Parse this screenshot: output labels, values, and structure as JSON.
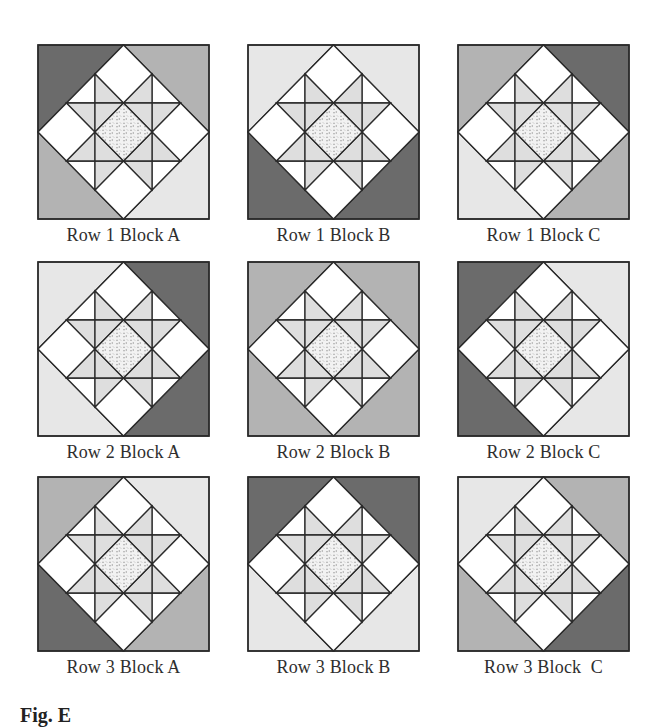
{
  "colors": {
    "dark": "#6b6b6b",
    "medium": "#b3b3b3",
    "light": "#e7e7e7",
    "star": "#dedede",
    "white": "#ffffff",
    "center_pattern_fg": "#9a9a9a",
    "center_pattern_bg": "#f2f2f2",
    "line": "#2a2a2a"
  },
  "blocks": [
    {
      "label": "Row 1 Block A",
      "corners": {
        "tl": "dark",
        "tr": "medium",
        "bl": "medium",
        "br": "light"
      }
    },
    {
      "label": "Row 1 Block B",
      "corners": {
        "tl": "light",
        "tr": "light",
        "bl": "dark",
        "br": "dark"
      }
    },
    {
      "label": "Row 1 Block C",
      "corners": {
        "tl": "medium",
        "tr": "dark",
        "bl": "light",
        "br": "medium"
      }
    },
    {
      "label": "Row 2 Block A",
      "corners": {
        "tl": "light",
        "tr": "dark",
        "bl": "light",
        "br": "dark"
      }
    },
    {
      "label": "Row 2 Block B",
      "corners": {
        "tl": "medium",
        "tr": "medium",
        "bl": "medium",
        "br": "medium"
      }
    },
    {
      "label": "Row 2 Block C",
      "corners": {
        "tl": "dark",
        "tr": "light",
        "bl": "dark",
        "br": "light"
      }
    },
    {
      "label": "Row 3 Block A",
      "corners": {
        "tl": "medium",
        "tr": "light",
        "bl": "dark",
        "br": "medium"
      }
    },
    {
      "label": "Row 3 Block B",
      "corners": {
        "tl": "dark",
        "tr": "dark",
        "bl": "light",
        "br": "light"
      }
    },
    {
      "label": "Row 3 Block  C",
      "corners": {
        "tl": "light",
        "tr": "medium",
        "bl": "medium",
        "br": "dark"
      }
    }
  ],
  "figure_caption": "Fig. E"
}
